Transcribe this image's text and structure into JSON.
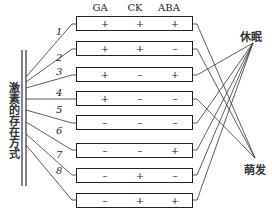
{
  "diagram": {
    "left_label": "激素的存在方式",
    "column_headers": [
      "GA",
      "CK",
      "ABA"
    ],
    "rows": [
      {
        "number": "1",
        "values": [
          "+",
          "+",
          "+"
        ],
        "outcome": "萌发"
      },
      {
        "number": "2",
        "values": [
          "+",
          "+",
          "–"
        ],
        "outcome": "萌发"
      },
      {
        "number": "3",
        "values": [
          "+",
          "–",
          "+"
        ],
        "outcome": "休眠"
      },
      {
        "number": "4",
        "values": [
          "+",
          "–",
          "–"
        ],
        "outcome": "萌发"
      },
      {
        "number": "5",
        "values": [
          "–",
          "–",
          "–"
        ],
        "outcome": "休眠"
      },
      {
        "number": "6",
        "values": [
          "–",
          "–",
          "+"
        ],
        "outcome": "休眠"
      },
      {
        "number": "7",
        "values": [
          "–",
          "+",
          "–"
        ],
        "outcome": "休眠"
      },
      {
        "number": "8",
        "values": [
          "–",
          "+",
          "+"
        ],
        "outcome": "休眠"
      }
    ],
    "outcomes": {
      "dormancy": "休眠",
      "germination": "萌发"
    },
    "line_color": "#222222"
  }
}
